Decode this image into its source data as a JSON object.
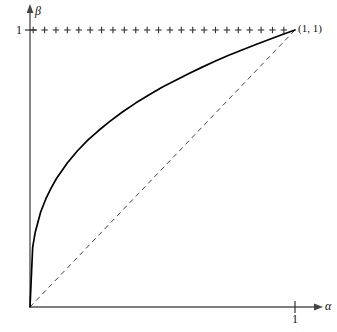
{
  "figure": {
    "name": "concavity-plot",
    "background": "#ffffff",
    "width": 337,
    "height": 332
  },
  "axes": {
    "x_label": "α",
    "y_label": "β",
    "x_tick_label": "1",
    "y_tick_label": "1",
    "origin_px": [
      30,
      307
    ],
    "x_unit_px": 295,
    "y_unit_px": 30,
    "axis_color": "#555555",
    "arrow_x_tip_px": 322,
    "arrow_y_tip_px": 5
  },
  "annotations": [
    {
      "name": "point-label-11",
      "text": "(1, 1)",
      "x_px": 298,
      "y_px": 23
    }
  ],
  "chart_data": {
    "type": "line",
    "title": "",
    "xlabel": "α",
    "ylabel": "β",
    "xlim": [
      0,
      1.09
    ],
    "ylim": [
      0,
      1.04
    ],
    "xticks": [
      1
    ],
    "xticklabels": [
      "1"
    ],
    "yticks": [
      1
    ],
    "yticklabels": [
      "1"
    ],
    "grid": false,
    "legend": "none",
    "series": [
      {
        "name": "concave-curve",
        "style": "solid",
        "color": "#000000",
        "width": 1.6,
        "description": "concave increasing curve from (0,0) to (1,1), beta = alpha^(1/3)",
        "x": [
          0,
          0.01,
          0.02,
          0.04,
          0.06,
          0.08,
          0.1,
          0.14,
          0.18,
          0.22,
          0.26,
          0.3,
          0.35,
          0.4,
          0.45,
          0.5,
          0.55,
          0.6,
          0.65,
          0.7,
          0.75,
          0.8,
          0.85,
          0.9,
          0.95,
          1
        ],
        "y": [
          0,
          0.215,
          0.271,
          0.342,
          0.391,
          0.43,
          0.464,
          0.519,
          0.565,
          0.604,
          0.638,
          0.669,
          0.705,
          0.737,
          0.766,
          0.794,
          0.819,
          0.843,
          0.866,
          0.888,
          0.909,
          0.928,
          0.947,
          0.965,
          0.983,
          1
        ]
      },
      {
        "name": "diagonal-reference-line",
        "style": "dashed",
        "color": "#444444",
        "width": 1,
        "description": "dashed identity line beta = alpha from (0,0) to (1,1)",
        "x": [
          0,
          1
        ],
        "y": [
          0,
          1
        ]
      },
      {
        "name": "plus-marker-row",
        "style": "markers",
        "marker": "plus",
        "color": "#333333",
        "description": "row of plus markers along beta = 1",
        "count": 23,
        "y_value": 1,
        "x": [
          0.012,
          0.055,
          0.098,
          0.141,
          0.184,
          0.227,
          0.27,
          0.313,
          0.356,
          0.399,
          0.442,
          0.485,
          0.528,
          0.571,
          0.614,
          0.657,
          0.7,
          0.743,
          0.786,
          0.829,
          0.872,
          0.915,
          0.958
        ]
      }
    ]
  }
}
